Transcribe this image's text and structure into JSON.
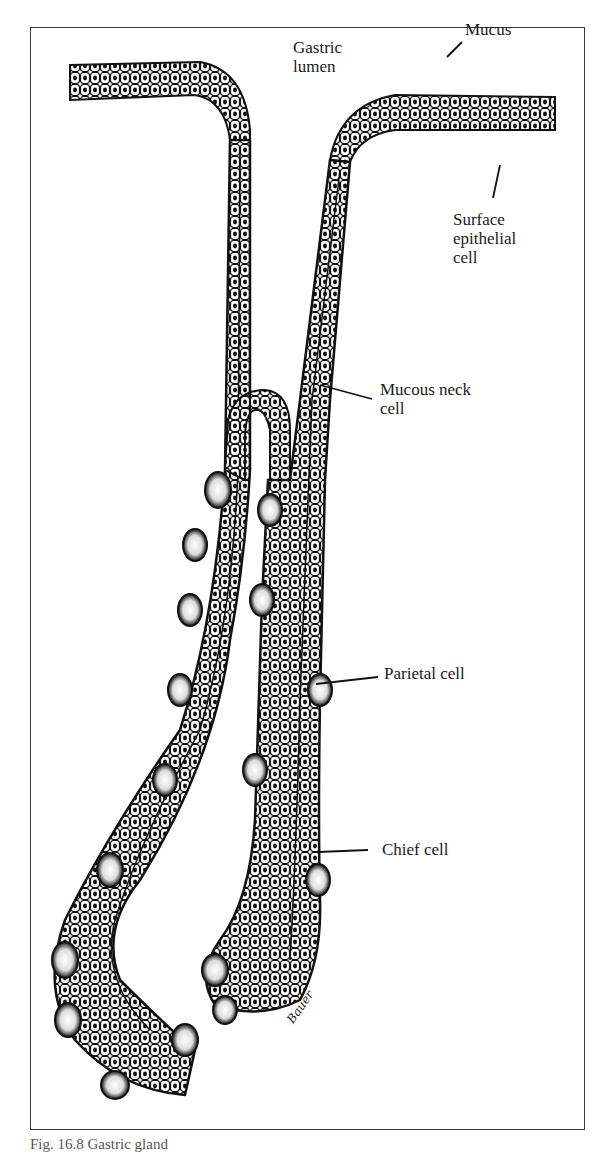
{
  "figure": {
    "subject": "Gastric gland",
    "labels": {
      "gastric_lumen": "Gastric\nlumen",
      "mucus": "Mucus",
      "surface_epithelial_cell": "Surface\nepithelial\ncell",
      "mucous_neck_cell": "Mucous neck\ncell",
      "parietal_cell": "Parietal cell",
      "chief_cell": "Chief cell"
    },
    "signature": "Bauer",
    "caption": "Fig. 16.8  Gastric gland"
  },
  "colors": {
    "ink": "#111111",
    "frame": "#3a3a3a",
    "background": "#ffffff"
  }
}
